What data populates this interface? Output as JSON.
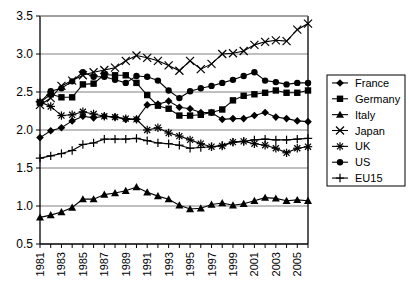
{
  "chart_data": {
    "type": "line",
    "title": "",
    "subtitle": "",
    "xlabel": "",
    "ylabel": "",
    "xlim": [
      1981,
      2006
    ],
    "ylim": [
      0.5,
      3.5
    ],
    "yticks": [
      "0.5",
      "1.0",
      "1.5",
      "2.0",
      "2.5",
      "3.0",
      "3.5"
    ],
    "ytick_values": [
      0.5,
      1.0,
      1.5,
      2.0,
      2.5,
      3.0,
      3.5
    ],
    "x": [
      1981,
      1982,
      1983,
      1984,
      1985,
      1986,
      1987,
      1988,
      1989,
      1990,
      1991,
      1992,
      1993,
      1994,
      1995,
      1996,
      1997,
      1998,
      1999,
      2000,
      2001,
      2002,
      2003,
      2004,
      2005,
      2006
    ],
    "xtick_labels": [
      "1981",
      "",
      "1983",
      "",
      "1985",
      "",
      "1987",
      "",
      "1989",
      "",
      "1991",
      "",
      "1993",
      "",
      "1995",
      "",
      "1997",
      "",
      "1999",
      "",
      "2001",
      "",
      "2003",
      "",
      "2005",
      ""
    ],
    "xtick_labels_shown": [
      "1981",
      "1983",
      "1985",
      "1987",
      "1989",
      "1991",
      "1993",
      "1995",
      "1997",
      "1999",
      "2001",
      "2003",
      "2005"
    ],
    "grid": "horizontal",
    "legend_position": "right",
    "series": [
      {
        "name": "France",
        "marker": "diamond",
        "values": [
          1.9,
          1.99,
          2.03,
          2.12,
          2.18,
          2.16,
          2.18,
          2.17,
          2.14,
          2.14,
          2.33,
          2.34,
          2.38,
          2.3,
          2.28,
          2.23,
          2.23,
          2.14,
          2.15,
          2.15,
          2.19,
          2.23,
          2.17,
          2.15,
          2.12,
          2.11
        ]
      },
      {
        "name": "Germany",
        "marker": "square",
        "values": [
          2.36,
          2.47,
          2.43,
          2.43,
          2.6,
          2.61,
          2.73,
          2.72,
          2.72,
          2.62,
          2.46,
          2.32,
          2.28,
          2.19,
          2.19,
          2.2,
          2.23,
          2.27,
          2.39,
          2.45,
          2.47,
          2.49,
          2.52,
          2.49,
          2.49,
          2.52
        ]
      },
      {
        "name": "Italy",
        "marker": "triangle",
        "values": [
          0.85,
          0.88,
          0.92,
          0.98,
          1.09,
          1.09,
          1.15,
          1.17,
          1.2,
          1.25,
          1.18,
          1.13,
          1.09,
          1.01,
          0.96,
          0.97,
          1.02,
          1.04,
          1.01,
          1.03,
          1.07,
          1.11,
          1.1,
          1.07,
          1.08,
          1.07
        ]
      },
      {
        "name": "Japan",
        "marker": "x",
        "values": [
          2.33,
          2.42,
          2.58,
          2.65,
          2.72,
          2.76,
          2.79,
          2.82,
          2.91,
          2.98,
          2.95,
          2.91,
          2.85,
          2.78,
          2.91,
          2.8,
          2.87,
          3.0,
          3.01,
          3.04,
          3.12,
          3.16,
          3.18,
          3.17,
          3.32,
          3.4
        ]
      },
      {
        "name": "UK",
        "marker": "asterisk",
        "values": [
          2.37,
          2.31,
          2.19,
          2.2,
          2.24,
          2.21,
          2.18,
          2.17,
          2.15,
          2.14,
          2.0,
          2.03,
          1.96,
          1.92,
          1.87,
          1.82,
          1.78,
          1.79,
          1.84,
          1.85,
          1.82,
          1.8,
          1.76,
          1.7,
          1.76,
          1.78
        ]
      },
      {
        "name": "US",
        "marker": "circle",
        "values": [
          2.36,
          2.51,
          2.55,
          2.64,
          2.76,
          2.7,
          2.7,
          2.66,
          2.62,
          2.71,
          2.7,
          2.65,
          2.52,
          2.42,
          2.51,
          2.55,
          2.58,
          2.62,
          2.66,
          2.71,
          2.76,
          2.65,
          2.63,
          2.6,
          2.62,
          2.62
        ]
      },
      {
        "name": "EU15",
        "marker": "plus",
        "values": [
          1.63,
          1.66,
          1.69,
          1.73,
          1.81,
          1.83,
          1.88,
          1.88,
          1.88,
          1.89,
          1.86,
          1.83,
          1.82,
          1.8,
          1.76,
          1.77,
          1.78,
          1.8,
          1.84,
          1.85,
          1.87,
          1.88,
          1.87,
          1.87,
          1.88,
          1.89
        ]
      }
    ]
  },
  "legend": {
    "items": [
      {
        "label": "France"
      },
      {
        "label": "Germany"
      },
      {
        "label": "Italy"
      },
      {
        "label": "Japan"
      },
      {
        "label": "UK"
      },
      {
        "label": "US"
      },
      {
        "label": "EU15"
      }
    ]
  },
  "colors": {
    "ink": "#000000",
    "grid": "#808080",
    "background": "#ffffff"
  }
}
